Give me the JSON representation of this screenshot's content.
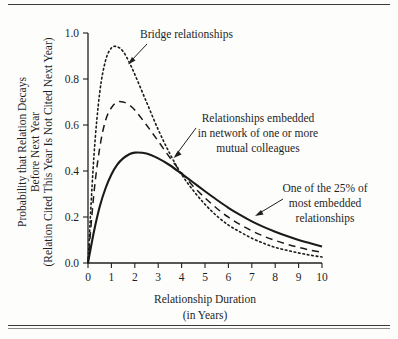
{
  "figure": {
    "background_color": "#fdfdfc",
    "ink_color": "#1a1a1a",
    "rule_top": "top-rule",
    "rule_bottom": "bottom-rule"
  },
  "chart_data": {
    "type": "line",
    "title": "",
    "subtitle": "",
    "xlabel": "Relationship Duration",
    "xlabel_line2": "(in Years)",
    "ylabel": "Probability that Relation Decays",
    "ylabel_line2": "Before Next Year",
    "ylabel_line3": "(Relation Cited This Year Is Not Cited Next Year)",
    "xlim": [
      0,
      10
    ],
    "ylim": [
      0.0,
      1.0
    ],
    "grid": false,
    "legend": "none (curves labeled by annotations)",
    "xticks": [
      "0",
      "1",
      "2",
      "3",
      "4",
      "5",
      "6",
      "7",
      "8",
      "9",
      "10"
    ],
    "xtick_values": [
      0,
      1,
      2,
      3,
      4,
      5,
      6,
      7,
      8,
      9,
      10
    ],
    "yticks": [
      "0.0",
      "0.2",
      "0.4",
      "0.6",
      "0.8",
      "1.0"
    ],
    "ytick_values": [
      0.0,
      0.2,
      0.4,
      0.6,
      0.8,
      1.0
    ],
    "x": [
      0,
      0.25,
      0.5,
      0.75,
      1.0,
      1.25,
      1.5,
      1.75,
      2.0,
      2.5,
      3.0,
      3.5,
      4.0,
      4.5,
      5.0,
      5.5,
      6.0,
      6.5,
      7.0,
      7.5,
      8.0,
      8.5,
      9.0,
      9.5,
      10.0
    ],
    "series": [
      {
        "name": "Bridge relationships",
        "style": "dotted",
        "peak_x": 1.2,
        "peak_y": 0.94,
        "values": [
          0.0,
          0.46,
          0.74,
          0.88,
          0.935,
          0.94,
          0.92,
          0.875,
          0.82,
          0.7,
          0.58,
          0.475,
          0.385,
          0.315,
          0.255,
          0.205,
          0.165,
          0.135,
          0.108,
          0.086,
          0.068,
          0.055,
          0.044,
          0.034,
          0.026
        ]
      },
      {
        "name": "Relationships embedded in network of one or more mutual colleagues",
        "style": "dashed",
        "peak_x": 1.5,
        "peak_y": 0.7,
        "values": [
          0.0,
          0.3,
          0.5,
          0.62,
          0.675,
          0.7,
          0.7,
          0.688,
          0.665,
          0.6,
          0.53,
          0.458,
          0.392,
          0.333,
          0.283,
          0.238,
          0.199,
          0.167,
          0.14,
          0.117,
          0.098,
          0.082,
          0.068,
          0.056,
          0.046
        ]
      },
      {
        "name": "One of the 25% of most embedded relationships",
        "style": "solid",
        "peak_x": 2.0,
        "peak_y": 0.48,
        "values": [
          0.0,
          0.135,
          0.245,
          0.325,
          0.385,
          0.428,
          0.455,
          0.472,
          0.48,
          0.476,
          0.455,
          0.425,
          0.388,
          0.35,
          0.312,
          0.275,
          0.24,
          0.209,
          0.181,
          0.157,
          0.136,
          0.117,
          0.1,
          0.086,
          0.072
        ]
      }
    ],
    "annotations": [
      {
        "id": "bridge",
        "lines": [
          "Bridge relationships"
        ],
        "points_to": {
          "x": 1.45,
          "y": 0.875
        }
      },
      {
        "id": "mutual-colleagues",
        "lines": [
          "Relationships embedded",
          "in network of one or more",
          "mutual colleagues"
        ],
        "points_to": {
          "x": 3.55,
          "y": 0.45
        }
      },
      {
        "id": "most-embedded",
        "lines": [
          "One of the 25% of",
          "most embedded",
          "relationships"
        ],
        "points_to": {
          "x": 7.0,
          "y": 0.185
        }
      }
    ]
  }
}
